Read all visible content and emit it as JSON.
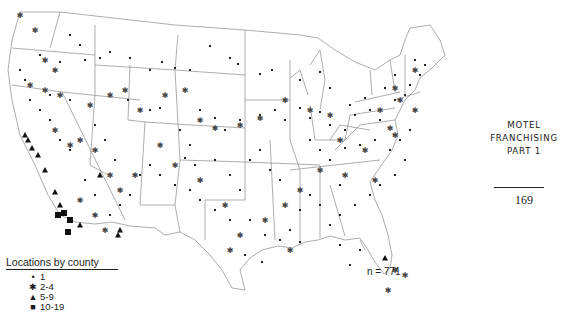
{
  "page": {
    "side_title_lines": [
      "MOTEL",
      "FRANCHISING",
      "PART 1"
    ],
    "page_number": "169"
  },
  "map": {
    "n_label": "n = 771",
    "legend": {
      "title": "Locations by county",
      "items": [
        {
          "symbol": "dot",
          "glyph": "•",
          "label": "1"
        },
        {
          "symbol": "asterisk",
          "glyph": "✱",
          "label": "2-4"
        },
        {
          "symbol": "triangle",
          "glyph": "▲",
          "label": "5-9"
        },
        {
          "symbol": "square",
          "glyph": "■",
          "label": "10-19"
        }
      ]
    }
  },
  "chart_data": {
    "type": "scatter",
    "title": "Locations by county",
    "total": 771,
    "categories": [
      "1",
      "2-4",
      "5-9",
      "10-19"
    ],
    "series": [
      {
        "name": "1",
        "points": [
          [
            70,
            35
          ],
          [
            80,
            45
          ],
          [
            40,
            55
          ],
          [
            60,
            62
          ],
          [
            85,
            60
          ],
          [
            100,
            58
          ],
          [
            110,
            52
          ],
          [
            130,
            58
          ],
          [
            150,
            70
          ],
          [
            162,
            62
          ],
          [
            175,
            68
          ],
          [
            190,
            70
          ],
          [
            210,
            46
          ],
          [
            230,
            58
          ],
          [
            238,
            64
          ],
          [
            260,
            74
          ],
          [
            272,
            70
          ],
          [
            300,
            80
          ],
          [
            320,
            72
          ],
          [
            330,
            88
          ],
          [
            128,
            100
          ],
          [
            150,
            110
          ],
          [
            160,
            108
          ],
          [
            180,
            130
          ],
          [
            190,
            145
          ],
          [
            200,
            110
          ],
          [
            215,
            118
          ],
          [
            225,
            130
          ],
          [
            240,
            120
          ],
          [
            260,
            115
          ],
          [
            275,
            110
          ],
          [
            285,
            120
          ],
          [
            300,
            108
          ],
          [
            310,
            118
          ],
          [
            320,
            112
          ],
          [
            330,
            125
          ],
          [
            345,
            130
          ],
          [
            355,
            115
          ],
          [
            370,
            110
          ],
          [
            380,
            120
          ],
          [
            395,
            100
          ],
          [
            405,
            95
          ],
          [
            410,
            85
          ],
          [
            420,
            75
          ],
          [
            425,
            65
          ],
          [
            415,
            60
          ],
          [
            395,
            75
          ],
          [
            385,
            88
          ],
          [
            365,
            98
          ],
          [
            350,
            105
          ],
          [
            310,
            140
          ],
          [
            320,
            150
          ],
          [
            330,
            160
          ],
          [
            345,
            148
          ],
          [
            360,
            145
          ],
          [
            375,
            140
          ],
          [
            390,
            150
          ],
          [
            400,
            140
          ],
          [
            410,
            130
          ],
          [
            405,
            160
          ],
          [
            395,
            175
          ],
          [
            380,
            185
          ],
          [
            370,
            195
          ],
          [
            355,
            205
          ],
          [
            340,
            215
          ],
          [
            330,
            225
          ],
          [
            320,
            205
          ],
          [
            310,
            195
          ],
          [
            300,
            210
          ],
          [
            290,
            230
          ],
          [
            280,
            240
          ],
          [
            265,
            235
          ],
          [
            250,
            220
          ],
          [
            230,
            220
          ],
          [
            215,
            210
          ],
          [
            200,
            200
          ],
          [
            190,
            190
          ],
          [
            175,
            185
          ],
          [
            160,
            175
          ],
          [
            150,
            165
          ],
          [
            140,
            175
          ],
          [
            130,
            195
          ],
          [
            120,
            205
          ],
          [
            110,
            215
          ],
          [
            95,
            195
          ],
          [
            85,
            180
          ],
          [
            70,
            150
          ],
          [
            60,
            140
          ],
          [
            50,
            120
          ],
          [
            40,
            110
          ],
          [
            30,
            100
          ],
          [
            25,
            80
          ],
          [
            20,
            70
          ],
          [
            50,
            95
          ],
          [
            70,
            100
          ],
          [
            95,
            125
          ],
          [
            105,
            140
          ],
          [
            115,
            160
          ],
          [
            250,
            160
          ],
          [
            260,
            150
          ],
          [
            270,
            170
          ],
          [
            280,
            180
          ],
          [
            240,
            190
          ],
          [
            230,
            175
          ],
          [
            215,
            160
          ],
          [
            195,
            165
          ],
          [
            185,
            158
          ],
          [
            245,
            255
          ],
          [
            262,
            262
          ],
          [
            300,
            242
          ],
          [
            340,
            245
          ],
          [
            350,
            265
          ],
          [
            360,
            250
          ],
          [
            340,
            185
          ]
        ]
      },
      {
        "name": "2-4",
        "points": [
          [
            20,
            15
          ],
          [
            35,
            30
          ],
          [
            45,
            60
          ],
          [
            55,
            70
          ],
          [
            30,
            85
          ],
          [
            45,
            90
          ],
          [
            60,
            95
          ],
          [
            70,
            145
          ],
          [
            55,
            130
          ],
          [
            80,
            140
          ],
          [
            95,
            150
          ],
          [
            110,
            175
          ],
          [
            90,
            105
          ],
          [
            110,
            95
          ],
          [
            125,
            90
          ],
          [
            140,
            110
          ],
          [
            165,
            95
          ],
          [
            185,
            90
          ],
          [
            200,
            120
          ],
          [
            215,
            128
          ],
          [
            240,
            125
          ],
          [
            260,
            118
          ],
          [
            285,
            100
          ],
          [
            310,
            110
          ],
          [
            330,
            115
          ],
          [
            340,
            140
          ],
          [
            365,
            150
          ],
          [
            380,
            110
          ],
          [
            395,
            88
          ],
          [
            415,
            70
          ],
          [
            395,
            135
          ],
          [
            375,
            180
          ],
          [
            345,
            175
          ],
          [
            320,
            170
          ],
          [
            300,
            190
          ],
          [
            285,
            205
          ],
          [
            265,
            220
          ],
          [
            240,
            235
          ],
          [
            225,
            205
          ],
          [
            200,
            180
          ],
          [
            175,
            165
          ],
          [
            160,
            145
          ],
          [
            135,
            175
          ],
          [
            120,
            190
          ],
          [
            80,
            200
          ],
          [
            95,
            215
          ],
          [
            105,
            230
          ],
          [
            230,
            250
          ],
          [
            290,
            250
          ],
          [
            388,
            290
          ],
          [
            395,
            270
          ],
          [
            405,
            275
          ],
          [
            415,
            110
          ],
          [
            400,
            100
          ],
          [
            390,
            128
          ]
        ]
      },
      {
        "name": "5-9",
        "points": [
          [
            25,
            135
          ],
          [
            28,
            140
          ],
          [
            32,
            148
          ],
          [
            38,
            155
          ],
          [
            45,
            170
          ],
          [
            55,
            192
          ],
          [
            60,
            205
          ],
          [
            80,
            225
          ],
          [
            100,
            175
          ],
          [
            118,
            235
          ],
          [
            120,
            230
          ],
          [
            385,
            258
          ]
        ]
      },
      {
        "name": "10-19",
        "points": [
          [
            58,
            215
          ],
          [
            64,
            213
          ],
          [
            70,
            220
          ],
          [
            68,
            232
          ]
        ]
      }
    ]
  }
}
